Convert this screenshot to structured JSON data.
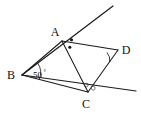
{
  "figure": {
    "background_color": "#ffffff",
    "stroke_color": "#1a1a1a",
    "width": 141,
    "height": 120,
    "vertices": [
      {
        "name": "A",
        "label": "A",
        "x": 62,
        "y": 41,
        "label_x": 55,
        "label_y": 36
      },
      {
        "name": "B",
        "label": "B",
        "x": 22,
        "y": 75,
        "label_x": 8,
        "label_y": 78
      },
      {
        "name": "C",
        "label": "C",
        "x": 88,
        "y": 92,
        "label_x": 82,
        "label_y": 107
      },
      {
        "name": "D",
        "label": "D",
        "x": 118,
        "y": 50,
        "label_x": 121,
        "label_y": 50
      }
    ],
    "segments": [
      {
        "name": "segment-BA",
        "from": "B",
        "to": "A"
      },
      {
        "name": "segment-BC",
        "from": "B",
        "to": "C"
      },
      {
        "name": "segment-AC",
        "from": "A",
        "to": "C"
      },
      {
        "name": "segment-AD",
        "from": "A",
        "to": "D"
      },
      {
        "name": "segment-DC",
        "from": "D",
        "to": "C"
      }
    ],
    "rays": [
      {
        "name": "ray-BA-extended",
        "description": "ray from B through A continuing up-right",
        "x1": 62,
        "y1": 41,
        "x2": 113,
        "y2": 6
      },
      {
        "name": "ray-BC-extended",
        "description": "ray from B through C continuing right",
        "x1": 88,
        "y1": 92,
        "x2": 136,
        "y2": 91
      }
    ],
    "angle_labels": [
      {
        "name": "angle-B-measure",
        "text": "50",
        "degree_symbol": "°",
        "x": 33,
        "y": 76
      }
    ],
    "markers": [
      {
        "name": "angle-mark-B-arc",
        "type": "arc",
        "at": "B",
        "description": "single arc marking angle ABC"
      },
      {
        "name": "angle-mark-A-dot-upper",
        "type": "dot",
        "at": "A",
        "x": 72,
        "y": 40,
        "description": "dot marking angle between ray A-up-right and A-D"
      },
      {
        "name": "angle-mark-A-dot-lower",
        "type": "dot",
        "at": "A",
        "x": 70,
        "y": 47,
        "description": "dot marking angle D-A-C"
      },
      {
        "name": "angle-mark-D-arc",
        "type": "arc",
        "at": "D",
        "description": "single arc marking angle ADC"
      },
      {
        "name": "angle-mark-C-circle-left",
        "type": "open-circle",
        "at": "C",
        "x": 86,
        "y": 85,
        "description": "open circle marking angle ACD"
      },
      {
        "name": "angle-mark-C-circle-right",
        "type": "open-circle",
        "at": "C",
        "x": 93,
        "y": 88,
        "description": "open circle marking angle DC-ray"
      }
    ]
  }
}
